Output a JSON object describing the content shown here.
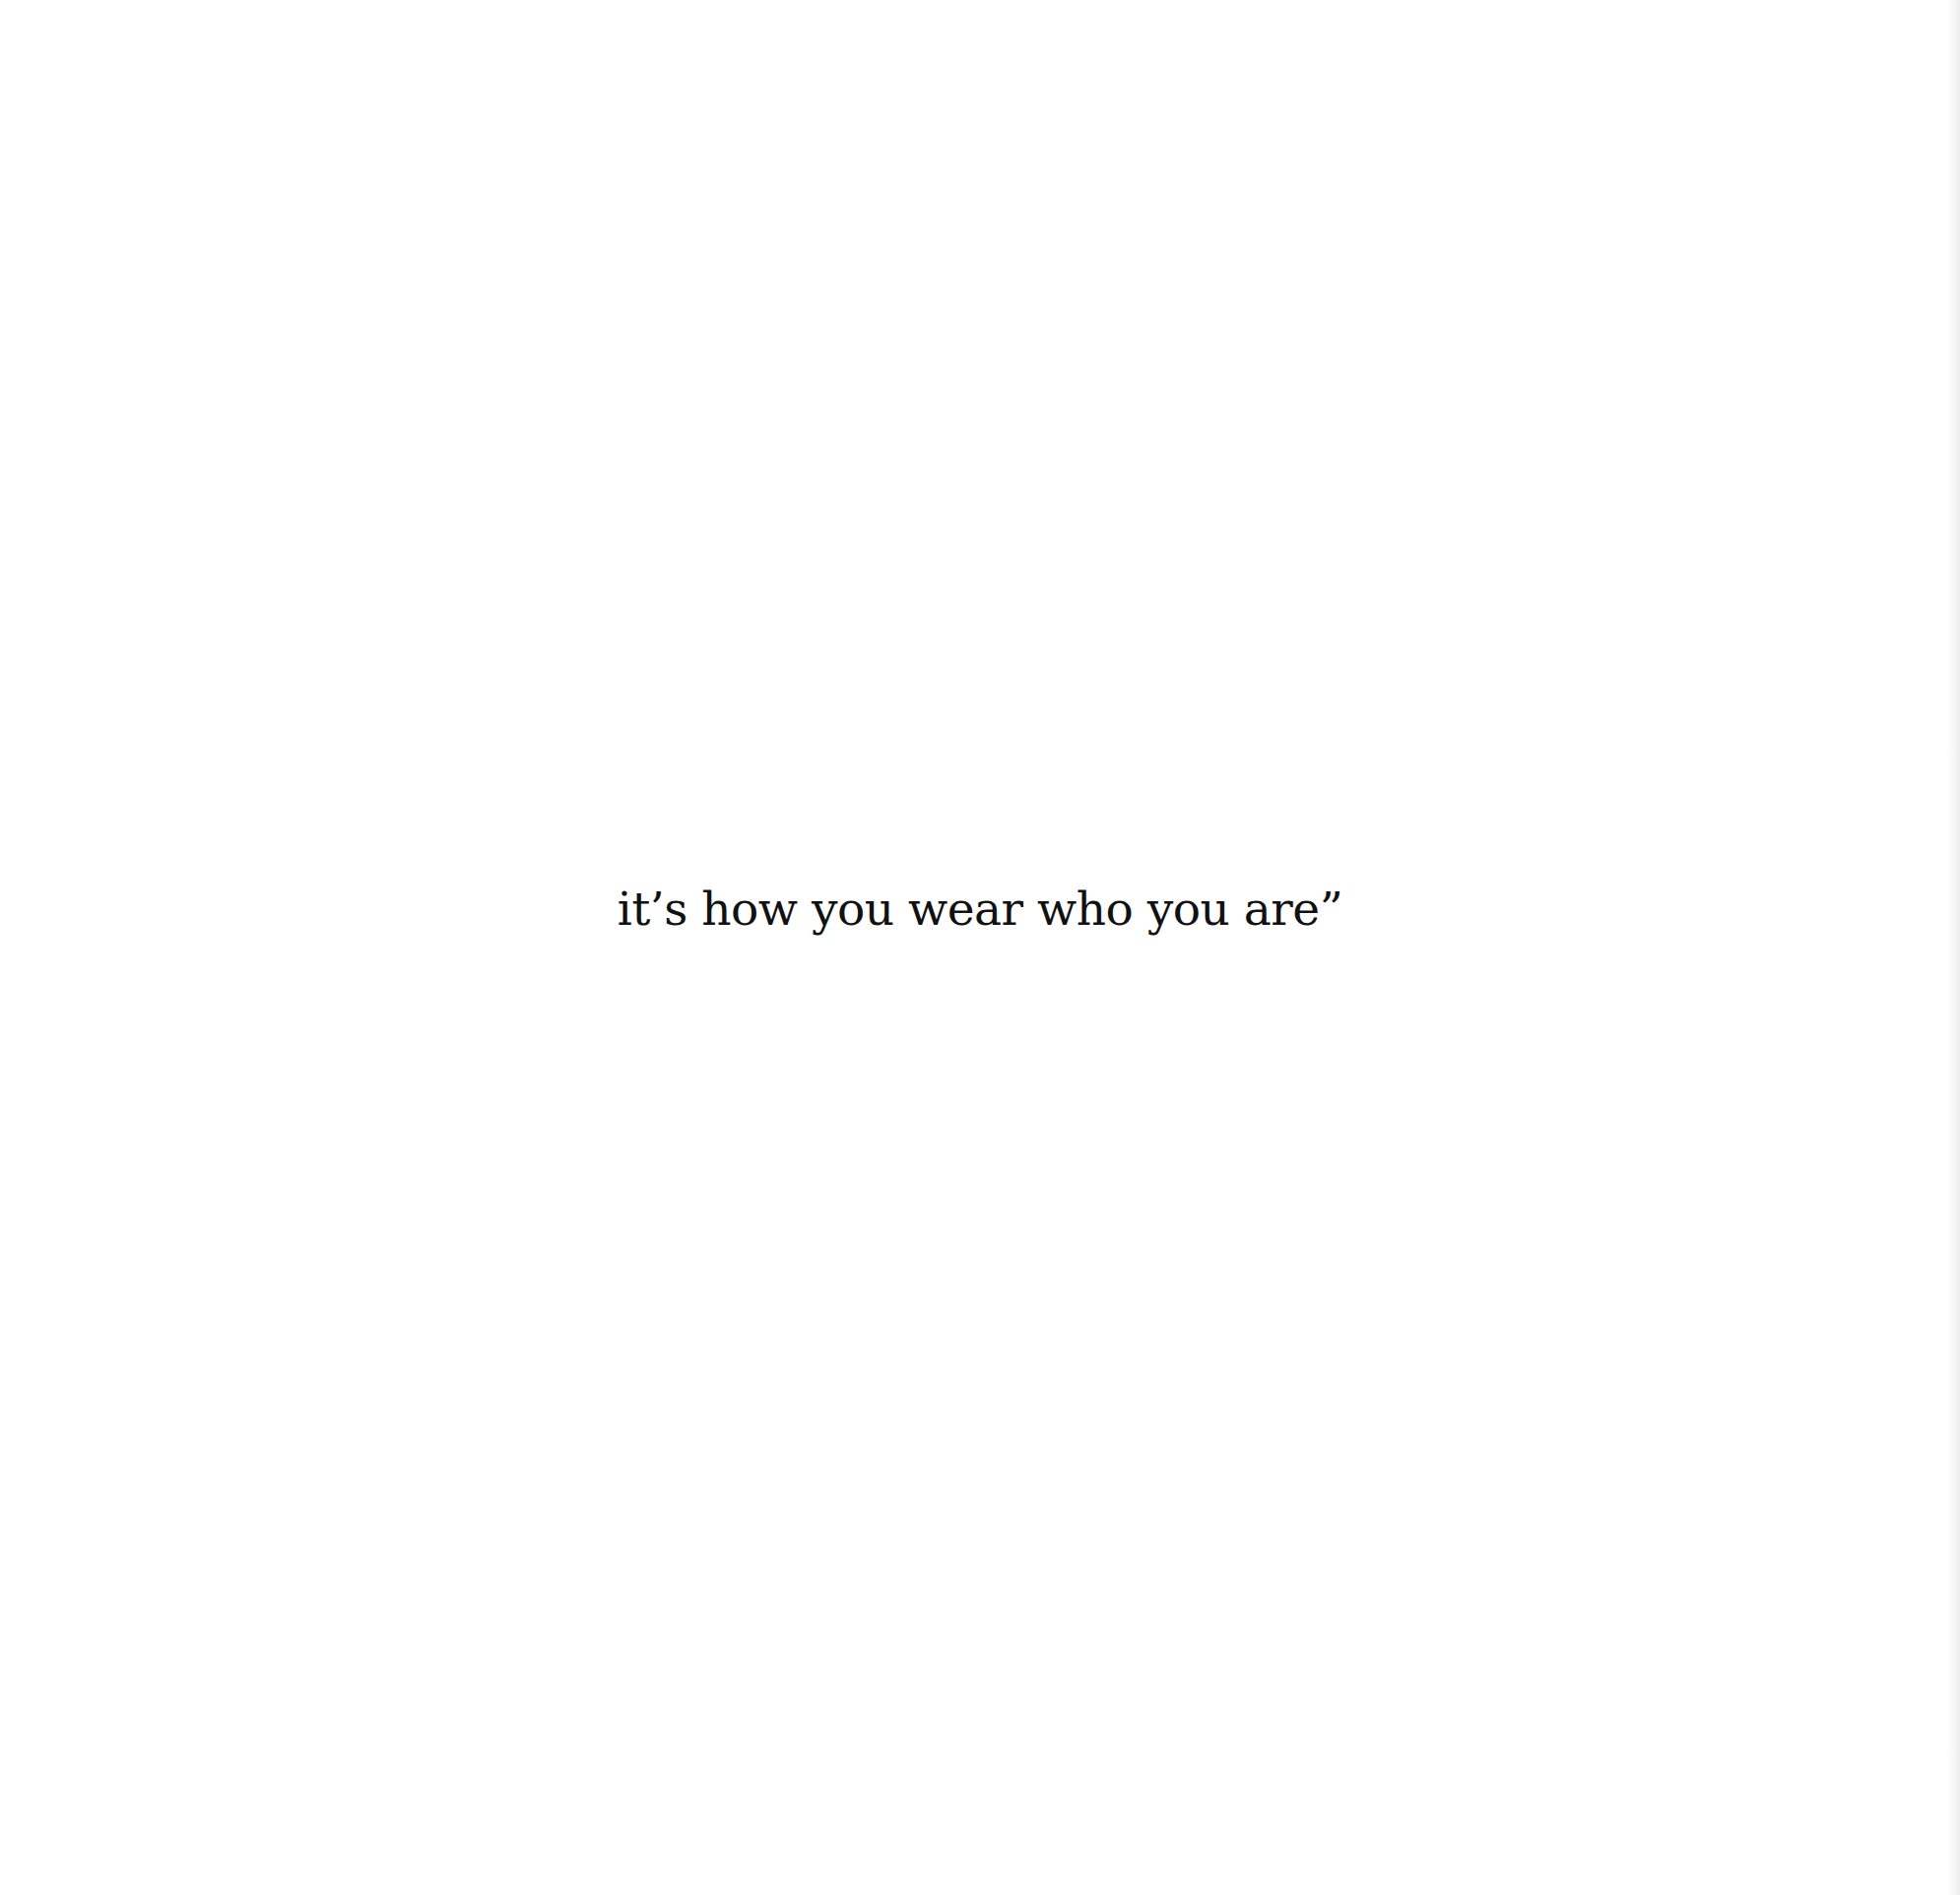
{
  "page": {
    "background_color": "#ffffff",
    "text_color": "#111111"
  },
  "quote": {
    "text": "it’s how you wear who you are”"
  }
}
